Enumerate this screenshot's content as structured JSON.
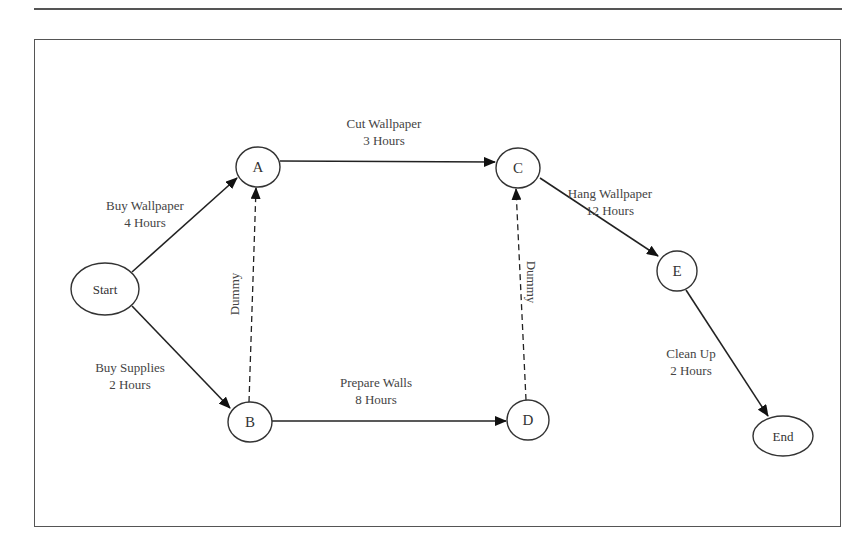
{
  "diagram": {
    "type": "activity-on-arrow network",
    "nodes": [
      {
        "id": "start",
        "label": "Start",
        "cx": 105,
        "cy": 289,
        "rx": 34,
        "ry": 26,
        "small": true
      },
      {
        "id": "a",
        "label": "A",
        "cx": 258,
        "cy": 167,
        "rx": 22,
        "ry": 20,
        "small": false
      },
      {
        "id": "b",
        "label": "B",
        "cx": 250,
        "cy": 422,
        "rx": 22,
        "ry": 20,
        "small": false
      },
      {
        "id": "c",
        "label": "C",
        "cx": 518,
        "cy": 168,
        "rx": 22,
        "ry": 20,
        "small": false
      },
      {
        "id": "d",
        "label": "D",
        "cx": 528,
        "cy": 420,
        "rx": 21,
        "ry": 20,
        "small": false
      },
      {
        "id": "e",
        "label": "E",
        "cx": 677,
        "cy": 271,
        "rx": 20,
        "ry": 20,
        "small": false
      },
      {
        "id": "end",
        "label": "End",
        "cx": 783,
        "cy": 436,
        "rx": 30,
        "ry": 20,
        "small": true
      }
    ],
    "edges": [
      {
        "id": "buy-wallpaper",
        "from": "start",
        "to": "a",
        "activity": "Buy Wallpaper",
        "duration": "4 Hours",
        "dashed": false,
        "x1": 132,
        "y1": 272,
        "x2": 237,
        "y2": 178,
        "label_x": 145,
        "label_y": 210,
        "rotate": 0
      },
      {
        "id": "buy-supplies",
        "from": "start",
        "to": "b",
        "activity": "Buy Supplies",
        "duration": "2 Hours",
        "dashed": false,
        "x1": 132,
        "y1": 306,
        "x2": 230,
        "y2": 408,
        "label_x": 130,
        "label_y": 372,
        "rotate": 0
      },
      {
        "id": "cut-wallpaper",
        "from": "a",
        "to": "c",
        "activity": "Cut Wallpaper",
        "duration": "3 Hours",
        "dashed": false,
        "x1": 280,
        "y1": 161,
        "x2": 495,
        "y2": 162,
        "label_x": 384,
        "label_y": 128,
        "rotate": 0
      },
      {
        "id": "prepare-walls",
        "from": "b",
        "to": "d",
        "activity": "Prepare Walls",
        "duration": "8 Hours",
        "dashed": false,
        "x1": 272,
        "y1": 421,
        "x2": 506,
        "y2": 421,
        "label_x": 376,
        "label_y": 387,
        "rotate": 0
      },
      {
        "id": "dummy-b-a",
        "from": "b",
        "to": "a",
        "activity": "Dummy",
        "duration": "",
        "dashed": true,
        "x1": 249,
        "y1": 402,
        "x2": 256,
        "y2": 188,
        "label_x": 236,
        "label_y": 294,
        "rotate": -90
      },
      {
        "id": "dummy-d-c",
        "from": "d",
        "to": "c",
        "activity": "Dummy",
        "duration": "",
        "dashed": true,
        "x1": 526,
        "y1": 400,
        "x2": 516,
        "y2": 189,
        "label_x": 530,
        "label_y": 282,
        "rotate": 90
      },
      {
        "id": "hang-wallpaper",
        "from": "c",
        "to": "e",
        "activity": "Hang Wallpaper",
        "duration": "12 Hours",
        "dashed": false,
        "x1": 540,
        "y1": 178,
        "x2": 658,
        "y2": 256,
        "label_x": 610,
        "label_y": 198,
        "rotate": 0
      },
      {
        "id": "clean-up",
        "from": "e",
        "to": "end",
        "activity": "Clean Up",
        "duration": "2 Hours",
        "dashed": false,
        "x1": 686,
        "y1": 290,
        "x2": 768,
        "y2": 416,
        "label_x": 691,
        "label_y": 358,
        "rotate": 0
      }
    ]
  },
  "colors": {
    "line": "#222222",
    "node_stroke": "#333333",
    "text": "#444444",
    "frame": "#555555"
  }
}
